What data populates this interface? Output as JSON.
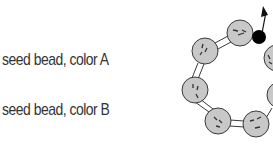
{
  "legend": {
    "items": [
      {
        "label": "seed bead, color A"
      },
      {
        "label": "seed bead, color B"
      }
    ]
  },
  "colors": {
    "bead_fill": "#c8c8c8",
    "bead_stroke": "#3a3a3a",
    "accent_bead": "#000000",
    "text": "#333333"
  },
  "diagram": {
    "beads": [
      {
        "cx": 240,
        "cy": 33,
        "r": 13,
        "type": "A"
      },
      {
        "cx": 205,
        "cy": 51,
        "r": 13,
        "type": "A"
      },
      {
        "cx": 195,
        "cy": 90,
        "r": 13,
        "type": "A"
      },
      {
        "cx": 218,
        "cy": 121,
        "r": 13,
        "type": "A"
      },
      {
        "cx": 256,
        "cy": 124,
        "r": 13,
        "type": "A"
      },
      {
        "cx": 277,
        "cy": 58,
        "r": 13,
        "type": "A"
      },
      {
        "cx": 280,
        "cy": 95,
        "r": 13,
        "type": "A"
      }
    ],
    "accent_bead": {
      "cx": 259,
      "cy": 37,
      "r": 7
    },
    "arrow": {
      "x1": 262,
      "y1": 32,
      "x2": 266,
      "y2": 8
    }
  }
}
